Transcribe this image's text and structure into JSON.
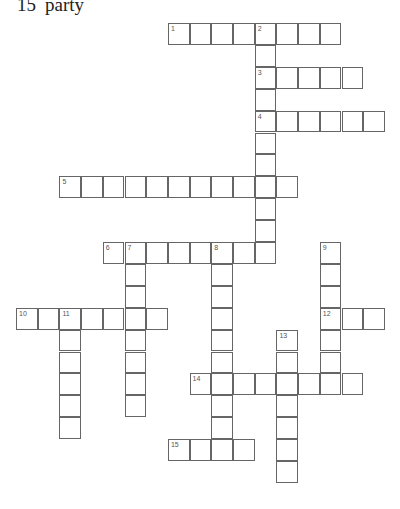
{
  "visible_clue": {
    "number": "15",
    "text": "party"
  },
  "grid": {
    "origin_x": 16,
    "origin_y": 23,
    "cell_w": 21.7,
    "cell_h": 21.9,
    "line_color": "#666666"
  },
  "entries": [
    {
      "number": 1,
      "direction": "across",
      "col": 7,
      "row": 0,
      "length": 8
    },
    {
      "number": 2,
      "direction": "down",
      "col": 11,
      "row": 0,
      "length": 11
    },
    {
      "number": 3,
      "direction": "across",
      "col": 11,
      "row": 2,
      "length": 5
    },
    {
      "number": 4,
      "direction": "across",
      "col": 11,
      "row": 4,
      "length": 6
    },
    {
      "number": 5,
      "direction": "across",
      "col": 2,
      "row": 7,
      "length": 11
    },
    {
      "number": 6,
      "direction": "across",
      "col": 4,
      "row": 10,
      "length": 8
    },
    {
      "number": 7,
      "direction": "down",
      "col": 5,
      "row": 10,
      "length": 8
    },
    {
      "number": 8,
      "direction": "down",
      "col": 9,
      "row": 10,
      "length": 10
    },
    {
      "number": 9,
      "direction": "down",
      "col": 14,
      "row": 10,
      "length": 7
    },
    {
      "number": 10,
      "direction": "across",
      "col": 0,
      "row": 13,
      "length": 7
    },
    {
      "number": 11,
      "direction": "down",
      "col": 2,
      "row": 13,
      "length": 6
    },
    {
      "number": 12,
      "direction": "across",
      "col": 14,
      "row": 13,
      "length": 3
    },
    {
      "number": 13,
      "direction": "down",
      "col": 12,
      "row": 14,
      "length": 7
    },
    {
      "number": 14,
      "direction": "across",
      "col": 8,
      "row": 16,
      "length": 8
    },
    {
      "number": 15,
      "direction": "across",
      "col": 7,
      "row": 19,
      "length": 4
    }
  ]
}
